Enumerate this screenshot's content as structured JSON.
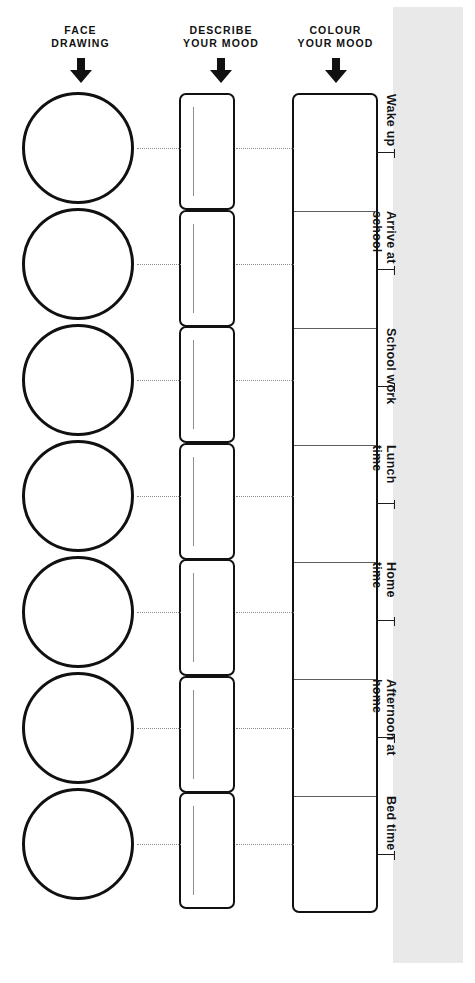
{
  "worksheet": {
    "title": "Mood Tracker Worksheet",
    "background_color": "#ffffff",
    "ink_color": "#111111",
    "panel_color": "#e9e9e9"
  },
  "columns": [
    {
      "id": "face-drawing",
      "header": "FACE\nDRAWING",
      "arrow_icon": "down-arrow-icon",
      "field_type": "circle",
      "count": 7
    },
    {
      "id": "describe-your-mood",
      "header": "DESCRIBE\nYOUR MOOD",
      "arrow_icon": "down-arrow-icon",
      "field_type": "text-box",
      "count": 7
    },
    {
      "id": "colour-your-mood",
      "header": "COLOUR\nYOUR MOOD",
      "arrow_icon": "down-arrow-icon",
      "field_type": "colour-cell",
      "count": 7
    }
  ],
  "rows": [
    {
      "label": "Wake up"
    },
    {
      "label": "Arrive at\nschool"
    },
    {
      "label": "School work"
    },
    {
      "label": "Lunch\ntime"
    },
    {
      "label": "Home\ntime"
    },
    {
      "label": "Afternoon at\nhome"
    },
    {
      "label": "Bed time"
    }
  ]
}
